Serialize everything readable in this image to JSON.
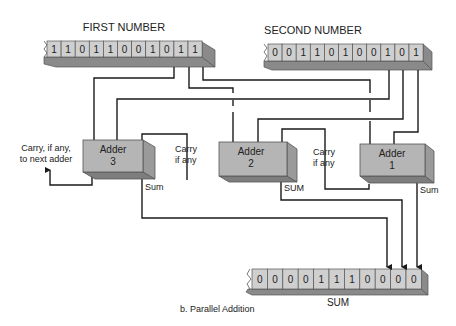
{
  "registers": {
    "first": {
      "title": "FIRST NUMBER",
      "bits": [
        "1",
        "1",
        "0",
        "1",
        "1",
        "0",
        "0",
        "1",
        "0",
        "1",
        "1"
      ]
    },
    "second": {
      "title": "SECOND NUMBER",
      "bits": [
        "0",
        "0",
        "1",
        "1",
        "0",
        "1",
        "0",
        "0",
        "1",
        "0",
        "1"
      ]
    },
    "sum": {
      "title": "SUM",
      "bits": [
        "0",
        "0",
        "0",
        "0",
        "1",
        "1",
        "1",
        "0",
        "0",
        "0",
        "0"
      ]
    }
  },
  "adders": [
    {
      "name": "Adder",
      "index": "3",
      "output_label": "Sum"
    },
    {
      "name": "Adder",
      "index": "2",
      "output_label": "SUM"
    },
    {
      "name": "Adder",
      "index": "1",
      "output_label": "Sum"
    }
  ],
  "annotations": {
    "carry_out_line1": "Carry, if any,",
    "carry_out_line2": "to next adder",
    "carry_2_to_3_line1": "Carry",
    "carry_2_to_3_line2": "if any",
    "carry_1_to_2_line1": "Carry",
    "carry_1_to_2_line2": "if any"
  },
  "caption": "b.   Parallel Addition"
}
